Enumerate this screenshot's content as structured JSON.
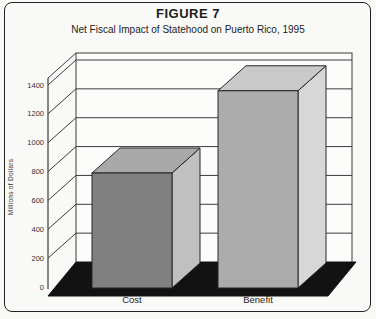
{
  "figure": {
    "title": "FIGURE 7",
    "subtitle": "Net Fiscal Impact of Statehood on Puerto Rico, 1995"
  },
  "chart_data": {
    "type": "bar",
    "projection": "3d",
    "title": "FIGURE 7",
    "subtitle": "Net Fiscal Impact of Statehood on Puerto Rico, 1995",
    "categories": [
      "Cost",
      "Benefit"
    ],
    "values": [
      790,
      1360
    ],
    "xlabel": "",
    "ylabel": "Millions of Dollars",
    "ylim": [
      0,
      1400
    ],
    "ytick_step": 200,
    "yticks": [
      0,
      200,
      400,
      600,
      800,
      1000,
      1200,
      1400
    ],
    "grid": true,
    "legend": false,
    "bar_colors": [
      {
        "front": "#808080",
        "top": "#a9a9a9",
        "side": "#c0c0c0"
      },
      {
        "front": "#acacac",
        "top": "#c9c9c9",
        "side": "#d7d7d7"
      }
    ],
    "floor_color": "#121212",
    "wall_color": "#fcfcfb",
    "line_color": "#3c3c3c",
    "edge_color": "#262626",
    "label_color": "#333333"
  }
}
